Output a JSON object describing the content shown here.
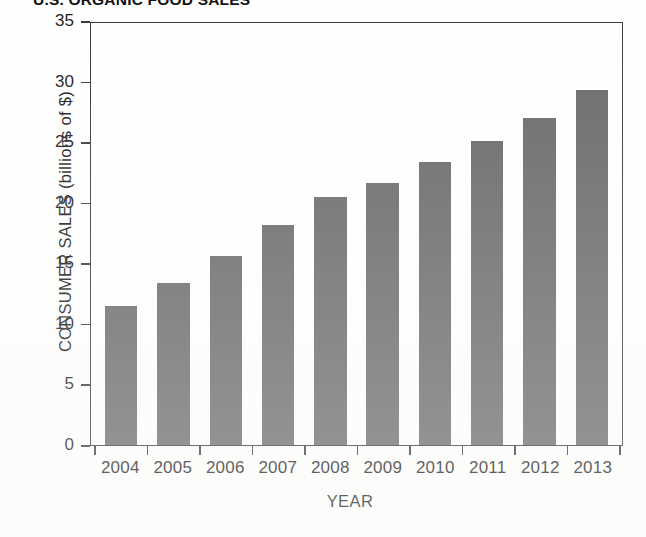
{
  "chart_data": {
    "type": "bar",
    "title": "U.S. ORGANIC FOOD SALES",
    "xlabel": "YEAR",
    "ylabel": "CONSUMER SALES (billions of $)",
    "categories": [
      "2004",
      "2005",
      "2006",
      "2007",
      "2008",
      "2009",
      "2010",
      "2011",
      "2012",
      "2013"
    ],
    "values": [
      11.5,
      13.4,
      15.6,
      18.2,
      20.5,
      21.6,
      23.4,
      25.1,
      27.0,
      29.3
    ],
    "ylim": [
      0,
      35
    ],
    "yticks": [
      "0",
      "5",
      "10",
      "15",
      "20",
      "25",
      "30",
      "35"
    ],
    "ytick_values": [
      0,
      5,
      10,
      15,
      20,
      25,
      30,
      35
    ],
    "grid": false,
    "legend": "none",
    "bar_color": "#6a6a6a",
    "axis_color": "#3a3a3a",
    "background": "#ffffff"
  }
}
